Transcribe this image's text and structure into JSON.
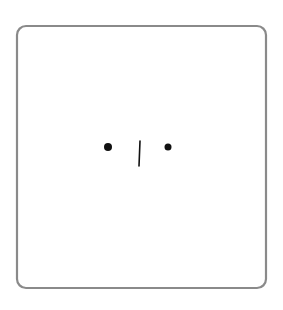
{
  "figure": {
    "colors": {
      "frame": "#8a8a8a",
      "marks": "#111111",
      "background": "#ffffff"
    },
    "frame": {
      "x": 17,
      "y": 26,
      "width": 249,
      "height": 262,
      "radius": 9
    },
    "dots": [
      {
        "name": "left-dot",
        "cx": 108,
        "cy": 147,
        "r": 4
      },
      {
        "name": "right-dot",
        "cx": 168,
        "cy": 147,
        "r": 3.5
      }
    ],
    "line": {
      "x1": 140,
      "y1": 141,
      "x2": 139,
      "y2": 166
    }
  }
}
